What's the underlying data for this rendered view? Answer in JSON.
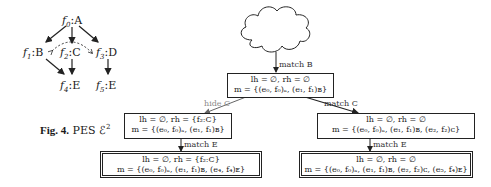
{
  "pes": {
    "nodes": [
      {
        "id": "f0",
        "event": "f",
        "sub": "0",
        "label": "A"
      },
      {
        "id": "f1",
        "event": "f",
        "sub": "1",
        "label": "B"
      },
      {
        "id": "f2",
        "event": "f",
        "sub": "2",
        "label": "C"
      },
      {
        "id": "f3",
        "event": "f",
        "sub": "3",
        "label": "D"
      },
      {
        "id": "f4",
        "event": "f",
        "sub": "4",
        "label": "E"
      },
      {
        "id": "f5",
        "event": "f",
        "sub": "5",
        "label": "E"
      }
    ],
    "causality": [
      [
        "f0",
        "f1"
      ],
      [
        "f0",
        "f2"
      ],
      [
        "f0",
        "f3"
      ],
      [
        "f1",
        "f4"
      ],
      [
        "f2",
        "f4"
      ],
      [
        "f3",
        "f5"
      ]
    ],
    "conflict": [
      [
        "f1",
        "f3"
      ]
    ]
  },
  "caption": {
    "fig": "Fig. 4.",
    "text": "PES ℰ",
    "sup": "2"
  },
  "tree": {
    "boxes": {
      "top": {
        "line1": "lh = ∅, rh = ∅",
        "line2": "m = {(e₀, f₀)ₐ, (e₁, f₁)ʙ}"
      },
      "mid_left": {
        "line1": "lh = ∅, rh = {f₂:C}",
        "line2": "m = {(e₀, f₀)ₐ, (e₁, f₁)ʙ}"
      },
      "mid_right": {
        "line1": "lh = ∅, rh = ∅",
        "line2": "m = {(e₀, f₀)ₐ, (e₁, f₁)ʙ, (e₂, f₂)ᴄ}"
      },
      "bot_left": {
        "line1": "lh = ∅, rh = {f₂:C}",
        "line2": "m = {(e₀, f₀)ₐ, (e₁, f₁)ʙ, (e₄, f₄)ᴇ}"
      },
      "bot_right": {
        "line1": "lh = ∅, rh = ∅",
        "line2": "m = {(e₀, f₀)ₐ, (e₁, f₁)ʙ, (e₂, f₂)ᴄ, (e₅, f₄)ᴇ}"
      }
    },
    "edges": {
      "cloud_to_top": "match B",
      "top_to_mid_left": "hide C",
      "top_to_mid_right": "match C",
      "mid_left_to_bot_left": "match E",
      "mid_right_to_bot_right": "match E"
    }
  }
}
